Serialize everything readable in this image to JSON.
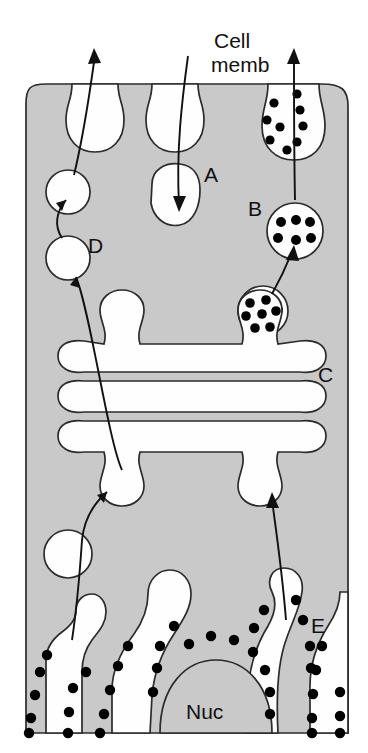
{
  "figure": {
    "title_label": "Cell memb",
    "title_line1": "Cell",
    "title_line2": "memb",
    "nucleus_label": "Nuc",
    "labels": {
      "a": "A",
      "b": "B",
      "c": "C",
      "d": "D",
      "e": "E"
    },
    "colors": {
      "cytoplasm_fill": "#c9c9c9",
      "organelle_fill": "#fefefe",
      "outline": "#2b2b2b",
      "granule_fill": "#000000",
      "ribosome_fill": "#000000",
      "nucleus_fill": "#c9c9c9",
      "background": "#ffffff",
      "text": "#111111"
    },
    "structures": [
      {
        "name": "cell-membrane",
        "label": "Cell memb",
        "description": "outer boundary of the cell with three membrane invaginations at the top"
      },
      {
        "name": "endocytic-pit-left",
        "description": "flask shaped invagination, empty"
      },
      {
        "name": "endocytic-pit-middle",
        "description": "flask shaped invagination, empty"
      },
      {
        "name": "endocytic-pit-right",
        "description": "flask shaped invagination filled with dense granules"
      },
      {
        "name": "vesicle-a",
        "label": "A",
        "description": "large irregular clear vesicle in cytoplasm"
      },
      {
        "name": "vesicle-b",
        "label": "B",
        "description": "round vesicle containing six dense granules"
      },
      {
        "name": "golgi-stack",
        "label": "C",
        "description": "stack of three flattened cisternae"
      },
      {
        "name": "transport-vesicle-d",
        "label": "D",
        "description": "clear vesicle moving from Golgi toward cell membrane"
      },
      {
        "name": "rough-er",
        "label": "E",
        "description": "rough endoplasmic reticulum studded with ribosomes"
      },
      {
        "name": "nucleus",
        "label": "Nuc",
        "description": "nucleus at bottom centre of the cell"
      }
    ],
    "granule_counts": {
      "endocytic_pit_right": 9,
      "vesicle_b": 6,
      "vesicle_below_b": 7,
      "golgi_bud_right": 7
    }
  }
}
